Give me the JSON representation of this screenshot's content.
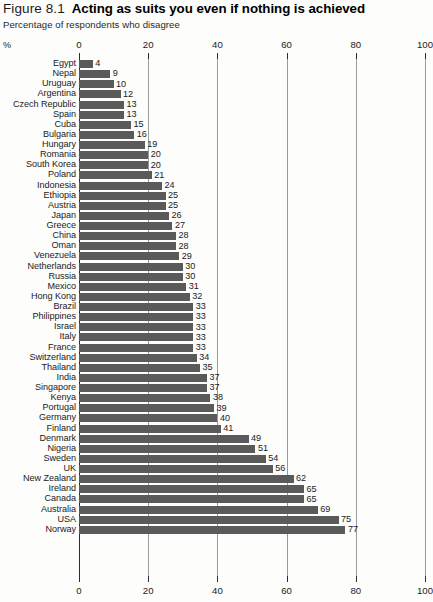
{
  "header": {
    "figure_number": "Figure 8.1",
    "title": "Acting as suits you even if nothing is achieved",
    "subtitle": "Percentage of respondents who disagree"
  },
  "axis": {
    "unit_label": "%",
    "ticks": [
      "0",
      "20",
      "40",
      "60",
      "80",
      "100"
    ]
  },
  "chart_data": {
    "type": "bar",
    "orientation": "horizontal",
    "title": "Acting as suits you even if nothing is achieved",
    "subtitle": "Percentage of respondents who disagree",
    "xlabel": "%",
    "ylabel": "",
    "xlim": [
      0,
      100
    ],
    "xticks": [
      0,
      20,
      40,
      60,
      80,
      100
    ],
    "grid": true,
    "legend": false,
    "bar_color": "#5a5a5a",
    "categories": [
      "Egypt",
      "Nepal",
      "Uruguay",
      "Argentina",
      "Czech Republic",
      "Spain",
      "Cuba",
      "Bulgaria",
      "Hungary",
      "Romania",
      "South Korea",
      "Poland",
      "Indonesia",
      "Ethiopia",
      "Austria",
      "Japan",
      "Greece",
      "China",
      "Oman",
      "Venezuela",
      "Netherlands",
      "Russia",
      "Mexico",
      "Hong Kong",
      "Brazil",
      "Philippines",
      "Israel",
      "Italy",
      "France",
      "Switzerland",
      "Thailand",
      "India",
      "Singapore",
      "Kenya",
      "Portugal",
      "Germany",
      "Finland",
      "Denmark",
      "Nigeria",
      "Sweden",
      "UK",
      "New Zealand",
      "Ireland",
      "Canada",
      "Australia",
      "USA",
      "Norway"
    ],
    "values": [
      4,
      9,
      10,
      12,
      13,
      13,
      15,
      16,
      19,
      20,
      20,
      21,
      24,
      25,
      25,
      26,
      27,
      28,
      28,
      29,
      30,
      30,
      31,
      32,
      33,
      33,
      33,
      33,
      33,
      34,
      35,
      37,
      37,
      38,
      39,
      40,
      41,
      49,
      51,
      54,
      56,
      62,
      65,
      65,
      69,
      75,
      77
    ]
  }
}
